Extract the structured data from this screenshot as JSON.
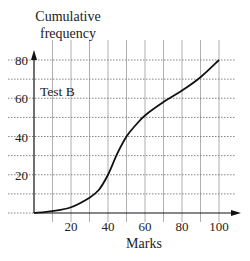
{
  "chart_data": {
    "type": "line",
    "title": "",
    "xlabel": "Marks",
    "ylabel": "Cumulative frequency",
    "ylabel_lines": [
      "Cumulative",
      "frequency"
    ],
    "annotation": "Test B",
    "xlim": [
      0,
      100
    ],
    "ylim": [
      0,
      80
    ],
    "x_ticks": [
      20,
      40,
      60,
      80,
      100
    ],
    "y_ticks": [
      20,
      40,
      60,
      80
    ],
    "grid": true,
    "grid_x_step": 10,
    "grid_y_step": 10,
    "series": [
      {
        "name": "Test B",
        "x": [
          0,
          10,
          20,
          30,
          35,
          40,
          45,
          50,
          55,
          60,
          70,
          80,
          90,
          100
        ],
        "values": [
          0,
          1,
          3,
          8,
          12,
          20,
          31,
          40,
          46,
          51,
          58,
          64,
          71,
          80
        ]
      }
    ]
  }
}
